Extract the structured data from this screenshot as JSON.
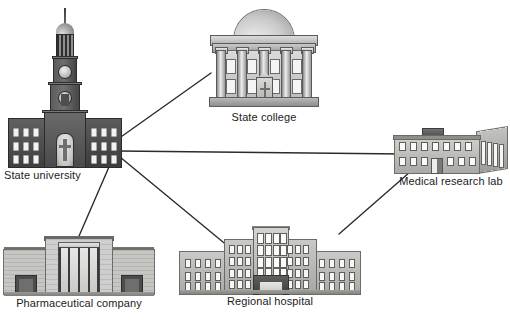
{
  "diagram": {
    "type": "node-link network illustration",
    "title": "",
    "background_color": "#ffffff",
    "edge_color": "#2b2b2b",
    "label_color": "#1c1c1c",
    "nodes": [
      {
        "id": "university",
        "label": "State university",
        "icon": "university-building-with-clock-tower",
        "x": 4,
        "y": 8
      },
      {
        "id": "college",
        "label": "State college",
        "icon": "neoclassical-domed-building",
        "x": 205,
        "y": 10
      },
      {
        "id": "lab",
        "label": "Medical research lab",
        "icon": "low-rise-laboratory-building",
        "x": 393,
        "y": 128
      },
      {
        "id": "pharma",
        "label": "Pharmaceutical company",
        "icon": "art-deco-corporate-building",
        "x": 4,
        "y": 234
      },
      {
        "id": "hospital",
        "label": "Regional hospital",
        "icon": "multi-wing-hospital-building",
        "x": 180,
        "y": 226
      }
    ],
    "edges": [
      {
        "id": "edge-university-college",
        "from": "university",
        "to": "college",
        "x1": 118,
        "y1": 139,
        "x2": 211,
        "y2": 73
      },
      {
        "id": "edge-university-lab",
        "from": "university",
        "to": "lab",
        "x1": 118,
        "y1": 151,
        "x2": 404,
        "y2": 154
      },
      {
        "id": "edge-university-hospital",
        "from": "university",
        "to": "hospital",
        "x1": 120,
        "y1": 157,
        "x2": 229,
        "y2": 247
      },
      {
        "id": "edge-university-pharma",
        "from": "university",
        "to": "pharma",
        "x1": 112,
        "y1": 160,
        "x2": 76,
        "y2": 243
      },
      {
        "id": "edge-hospital-lab",
        "from": "hospital",
        "to": "lab",
        "x1": 339,
        "y1": 234,
        "x2": 410,
        "y2": 172
      }
    ]
  }
}
